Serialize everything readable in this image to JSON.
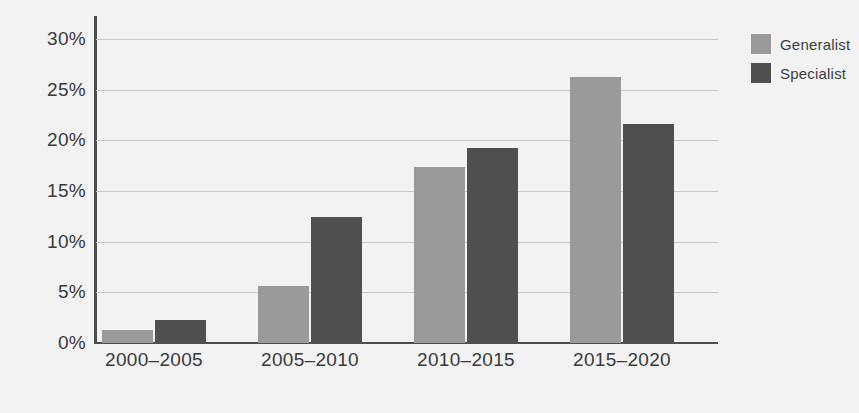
{
  "chart_data": {
    "type": "bar",
    "title": "",
    "subtitle": "",
    "xlabel": "",
    "ylabel": "",
    "categories": [
      "2000–2005",
      "2005–2010",
      "2010–2015",
      "2015–2020"
    ],
    "series": [
      {
        "name": "Generalist",
        "color": "#9a9a9a",
        "values": [
          1.3,
          5.6,
          17.4,
          26.3
        ]
      },
      {
        "name": "Specialist",
        "color": "#4f4f4f",
        "values": [
          2.3,
          12.4,
          19.2,
          21.6
        ]
      }
    ],
    "ylim": [
      0,
      30
    ],
    "ytick_values": [
      0,
      5,
      10,
      15,
      20,
      25,
      30
    ],
    "ytick_labels": [
      "0%",
      "5%",
      "10%",
      "15%",
      "20%",
      "25%",
      "30%"
    ],
    "grid": "horizontal",
    "legend_position": "top-right",
    "value_suffix": "%"
  },
  "legend": {
    "items": [
      {
        "label": "Generalist",
        "color": "#9a9a9a"
      },
      {
        "label": "Specialist",
        "color": "#4f4f4f"
      }
    ]
  },
  "axes": {
    "y_ticks": [
      {
        "label": "30%",
        "value": 30
      },
      {
        "label": "25%",
        "value": 25
      },
      {
        "label": "20%",
        "value": 20
      },
      {
        "label": "15%",
        "value": 15
      },
      {
        "label": "10%",
        "value": 10
      },
      {
        "label": "5%",
        "value": 5
      },
      {
        "label": "0%",
        "value": 0
      }
    ],
    "x_ticks": [
      {
        "label": "2000–2005"
      },
      {
        "label": "2005–2010"
      },
      {
        "label": "2010–2015"
      },
      {
        "label": "2015–2020"
      }
    ]
  },
  "colors": {
    "background": "#f2f2f2",
    "axis": "#4d4d4d",
    "gridline": "#c9c9c9",
    "text": "#3a3a3a",
    "generalist": "#9a9a9a",
    "specialist": "#4f4f4f"
  }
}
